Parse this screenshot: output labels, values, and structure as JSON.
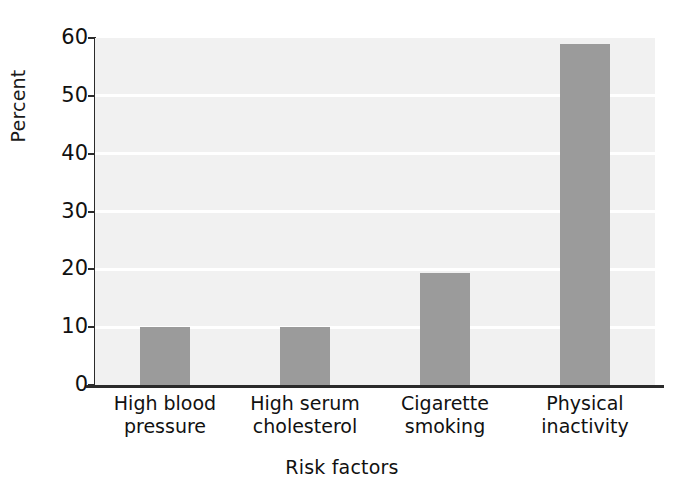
{
  "chart_data": {
    "type": "bar",
    "title": "",
    "xlabel": "Risk factors",
    "ylabel": "Percent",
    "categories": [
      "High blood\npressure",
      "High serum\ncholesterol",
      "Cigarette\nsmoking",
      "Physical\ninactivity"
    ],
    "values": [
      10,
      10,
      19.3,
      59
    ],
    "ylim": [
      0,
      60
    ],
    "yticks": [
      0,
      10,
      20,
      30,
      40,
      50,
      60
    ],
    "ytick_labels": [
      "0",
      "10",
      "20",
      "30",
      "40",
      "50",
      "60"
    ],
    "grid": "horizontal-white-lines",
    "legend": "none",
    "bar_color": "#9b9b9b",
    "plot_background": "#f1f1f1",
    "gridline_color": "#ffffff",
    "axis_color": "#2b2b2b",
    "text_color": "#111111"
  }
}
